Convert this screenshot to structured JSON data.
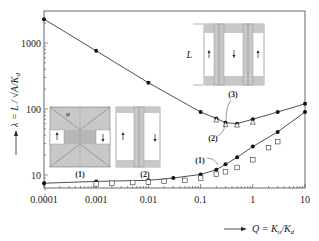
{
  "chart_data": {
    "type": "line",
    "title": "",
    "xlabel": "Q = K_u/K_d",
    "ylabel": "λ = L / √(A/K_d)",
    "xscale": "log",
    "yscale": "log",
    "xlim": [
      0.0001,
      10
    ],
    "ylim": [
      4,
      2800
    ],
    "grid": false,
    "x_ticks": [
      "0.0001",
      "0.001",
      "0.01",
      "0.1",
      "1",
      "10"
    ],
    "y_ticks": [
      "10",
      "100",
      "1000"
    ],
    "series": [
      {
        "name": "upper curve (domain type 2 / 3)",
        "style": "line+filled-circle",
        "x": [
          0.0001,
          0.001,
          0.01,
          0.1,
          0.2,
          0.3,
          0.5,
          1,
          3,
          10
        ],
        "y": [
          2300,
          760,
          250,
          90,
          72,
          62,
          60,
          70,
          90,
          120
        ]
      },
      {
        "name": "upper open triangles",
        "style": "open-triangle",
        "x": [
          0.2,
          0.3,
          0.5,
          1
        ],
        "y": [
          68,
          58,
          57,
          63
        ]
      },
      {
        "name": "lower curve (domain type 1)",
        "style": "line+filled-circle",
        "x": [
          0.0001,
          0.001,
          0.01,
          0.03,
          0.1,
          0.2,
          0.3,
          0.5,
          1,
          3,
          10
        ],
        "y": [
          7.5,
          8.0,
          8.3,
          9.0,
          10.2,
          12.0,
          14.5,
          18.5,
          27,
          45,
          90
        ]
      },
      {
        "name": "lower open squares",
        "style": "open-square",
        "x": [
          0.001,
          0.002,
          0.005,
          0.01,
          0.02,
          0.05,
          0.1,
          0.2,
          0.3,
          0.5,
          1,
          2,
          3
        ],
        "y": [
          7.3,
          7.5,
          7.7,
          7.8,
          8.0,
          8.3,
          9.0,
          10.3,
          11.2,
          13.0,
          17,
          26,
          32
        ]
      }
    ],
    "annotations": [
      "(1)",
      "(2)",
      "(3)"
    ],
    "insets": [
      {
        "label": "(1)",
        "annotation": "φ"
      },
      {
        "label": "(2)"
      },
      {
        "label": "(3)",
        "dimension_label": "L"
      }
    ]
  },
  "labels": {
    "ylabel_lambda": "λ = L / ",
    "ylabel_sqrt": "√A/K",
    "ylabel_sub": "d",
    "xlabel_q": "Q = K",
    "xlabel_u": "u",
    "xlabel_slash": "/K",
    "xlabel_d": "d",
    "phi": "φ",
    "L": "L",
    "ann1": "(1)",
    "ann2": "(2)",
    "ann3": "(3)",
    "inset1": "(1)",
    "inset2": "(2)"
  }
}
